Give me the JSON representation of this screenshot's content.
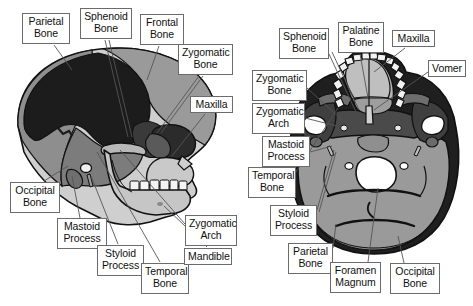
{
  "figure": {
    "background_color": "#ffffff",
    "label_box": {
      "border_color": "#6b6b6b",
      "fill": "#ffffff",
      "text_color": "#101010"
    },
    "leader_line_color": "#555555",
    "palette": {
      "parietal_dark": "#1c1c1c",
      "temporal_mid_dark": "#4e4e4e",
      "sphenoid_dark": "#3a3a3a",
      "frontal_gray": "#9a9a9a",
      "occipital_gray": "#8e8e8e",
      "facial_light": "#cfcfcf",
      "mandible_light": "#c6c6c6",
      "teeth_white": "#f4f4f4",
      "outline": "#111111",
      "foramen_white": "#ffffff"
    }
  },
  "views": [
    {
      "name": "lateral-view",
      "description": "Left lateral view of the human skull",
      "labels": [
        {
          "id": "parietal-bone",
          "text": "Parietal\nBone",
          "x": 22,
          "y": 13,
          "w": 48,
          "h": 31,
          "target_x": 72,
          "target_y": 70
        },
        {
          "id": "sphenoid-bone",
          "text": "Sphenoid\nBone",
          "x": 80,
          "y": 8,
          "w": 52,
          "h": 31,
          "target_x": 128,
          "target_y": 137
        },
        {
          "id": "frontal-bone",
          "text": "Frontal\nBone",
          "x": 140,
          "y": 14,
          "w": 44,
          "h": 31,
          "target_x": 147,
          "target_y": 80
        },
        {
          "id": "zygomatic-bone",
          "text": "Zygomatic\nBone",
          "x": 178,
          "y": 44,
          "w": 55,
          "h": 31,
          "target_x": 155,
          "target_y": 135
        },
        {
          "id": "maxilla",
          "text": "Maxilla",
          "x": 190,
          "y": 96,
          "w": 43,
          "h": 17,
          "target_x": 170,
          "target_y": 155
        },
        {
          "id": "occipital-bone",
          "text": "Occipital\nBone",
          "x": 10,
          "y": 182,
          "w": 50,
          "h": 31,
          "target_x": 68,
          "target_y": 168
        },
        {
          "id": "mastoid-process",
          "text": "Mastoid\nProcess",
          "x": 57,
          "y": 218,
          "w": 50,
          "h": 31,
          "target_x": 73,
          "target_y": 175
        },
        {
          "id": "styloid-process",
          "text": "Styloid\nProcess",
          "x": 97,
          "y": 245,
          "w": 47,
          "h": 31,
          "target_x": 90,
          "target_y": 174
        },
        {
          "id": "temporal-bone",
          "text": "Temporal\nBone",
          "x": 141,
          "y": 263,
          "w": 48,
          "h": 31,
          "target_x": 96,
          "target_y": 153
        },
        {
          "id": "mandible",
          "text": "Mandible",
          "x": 184,
          "y": 248,
          "w": 48,
          "h": 17,
          "target_x": 160,
          "target_y": 167
        },
        {
          "id": "zygomatic-arch",
          "text": "Zygomatic\nArch",
          "x": 185,
          "y": 215,
          "w": 52,
          "h": 31,
          "target_x": 117,
          "target_y": 148
        }
      ]
    },
    {
      "name": "inferior-view",
      "description": "Inferior (basal) view of the human skull",
      "labels": [
        {
          "id": "sphenoid-bone-inf",
          "text": "Sphenoid\nBone",
          "x": 279,
          "y": 28,
          "w": 50,
          "h": 31,
          "target_x": 355,
          "target_y": 110
        },
        {
          "id": "palatine-bone",
          "text": "Palatine\nBone",
          "x": 338,
          "y": 22,
          "w": 46,
          "h": 31,
          "target_x": 366,
          "target_y": 97
        },
        {
          "id": "maxilla-inf",
          "text": "Maxilla",
          "x": 392,
          "y": 30,
          "w": 43,
          "h": 17,
          "target_x": 372,
          "target_y": 70
        },
        {
          "id": "vomer",
          "text": "Vomer",
          "x": 428,
          "y": 60,
          "w": 38,
          "h": 17,
          "target_x": 373,
          "target_y": 104
        },
        {
          "id": "zygomatic-bone-inf",
          "text": "Zygomatic\nBone",
          "x": 252,
          "y": 70,
          "w": 55,
          "h": 31,
          "target_x": 341,
          "target_y": 120
        },
        {
          "id": "zygomatic-arch-inf",
          "text": "Zygomatic\nArch",
          "x": 252,
          "y": 103,
          "w": 53,
          "h": 31,
          "target_x": 337,
          "target_y": 126
        },
        {
          "id": "mastoid-process-inf",
          "text": "Mastoid\nProcess",
          "x": 262,
          "y": 136,
          "w": 48,
          "h": 31,
          "target_x": 335,
          "target_y": 143
        },
        {
          "id": "temporal-bone-inf",
          "text": "Temporal\nBone",
          "x": 248,
          "y": 167,
          "w": 48,
          "h": 31,
          "target_x": 330,
          "target_y": 160
        },
        {
          "id": "styloid-process-inf",
          "text": "Styloid\nProcess",
          "x": 270,
          "y": 205,
          "w": 47,
          "h": 31,
          "target_x": 333,
          "target_y": 152
        },
        {
          "id": "parietal-bone-inf",
          "text": "Parietal\nBone",
          "x": 288,
          "y": 243,
          "w": 45,
          "h": 31,
          "target_x": 335,
          "target_y": 225
        },
        {
          "id": "foramen-magnum",
          "text": "Foramen\nMagnum",
          "x": 330,
          "y": 262,
          "w": 51,
          "h": 31,
          "target_x": 378,
          "target_y": 190
        },
        {
          "id": "occipital-bone-inf",
          "text": "Occipital\nBone",
          "x": 390,
          "y": 263,
          "w": 50,
          "h": 31,
          "target_x": 400,
          "target_y": 237
        }
      ]
    }
  ]
}
